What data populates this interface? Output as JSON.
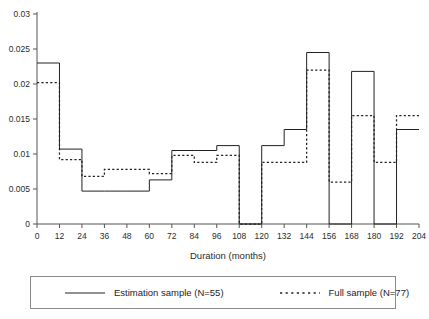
{
  "chart_data": {
    "type": "line",
    "subtype": "step-hazard",
    "title": "",
    "xlabel": "Duration (months)",
    "ylabel": "",
    "xlim": [
      0,
      204
    ],
    "ylim": [
      0,
      0.03
    ],
    "xticks": [
      0,
      12,
      24,
      36,
      48,
      60,
      72,
      84,
      96,
      108,
      120,
      132,
      144,
      156,
      168,
      180,
      192,
      204
    ],
    "yticks": [
      0,
      0.005,
      0.01,
      0.015,
      0.02,
      0.025,
      0.03
    ],
    "ytick_labels": [
      "0",
      "0.005",
      "0.01",
      "0.015",
      "0.02",
      "0.025",
      "0.03"
    ],
    "grid": false,
    "legend_position": "bottom",
    "intervals": [
      [
        0,
        12
      ],
      [
        12,
        24
      ],
      [
        24,
        36
      ],
      [
        36,
        48
      ],
      [
        48,
        60
      ],
      [
        60,
        72
      ],
      [
        72,
        84
      ],
      [
        84,
        96
      ],
      [
        96,
        108
      ],
      [
        108,
        120
      ],
      [
        120,
        132
      ],
      [
        132,
        144
      ],
      [
        144,
        156
      ],
      [
        156,
        168
      ],
      [
        168,
        180
      ],
      [
        180,
        192
      ],
      [
        192,
        204
      ]
    ],
    "series": [
      {
        "name": "Estimation sample (N=55)",
        "style": "solid",
        "values": [
          0.023,
          0.0107,
          0.0047,
          0.0047,
          0.0047,
          0.0063,
          0.0105,
          0.0105,
          0.0112,
          0.0,
          0.0112,
          0.0135,
          0.0245,
          0.0,
          0.0218,
          0.0,
          0.0135
        ]
      },
      {
        "name": "Full sample (N=77)",
        "style": "dotted",
        "values": [
          0.0202,
          0.0092,
          0.0068,
          0.0078,
          0.0078,
          0.0072,
          0.0098,
          0.0088,
          0.0098,
          0.0,
          0.0088,
          0.0088,
          0.022,
          0.006,
          0.0155,
          0.0088,
          0.0155
        ]
      }
    ]
  },
  "axes": {
    "x_title": "Duration (months)"
  },
  "legend": {
    "entries": [
      {
        "label": "Estimation sample (N=55)",
        "style": "solid"
      },
      {
        "label": "Full sample (N=77)",
        "style": "dotted"
      }
    ]
  }
}
